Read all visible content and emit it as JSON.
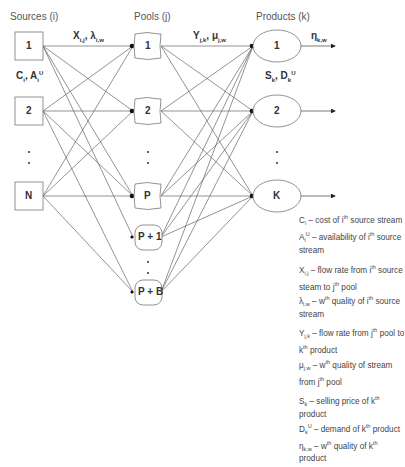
{
  "headers": {
    "sources": "Sources (i)",
    "pools": "Pools (j)",
    "products": "Products (k)"
  },
  "sources": [
    "1",
    "2",
    "N"
  ],
  "pools": [
    "1",
    "2",
    "P",
    "P + 1",
    "P + B"
  ],
  "products": [
    "1",
    "2",
    "K"
  ],
  "edge_labels": {
    "source_to_pool": "X i,j , λ i,w",
    "pool_to_product": "Y j,k , μ j,w",
    "product_out": "η k,w",
    "source_params": "C i , A i U",
    "product_params": "S k , D k U"
  },
  "legend": [
    [
      "C i – cost of i th source stream",
      "A i U – availability of i th source stream"
    ],
    [
      "X i,j – flow rate from i th source steam to j th pool",
      "λ i,w – w th quality of i th source stream"
    ],
    [
      "Y j,k – flow rate from j th pool to k th product",
      "μ j,w – w th quality of stream from j th pool"
    ],
    [
      "S k – selling price of k th product",
      "D k U – demand of k th product",
      "η k,w – w th quality of k th product"
    ]
  ]
}
